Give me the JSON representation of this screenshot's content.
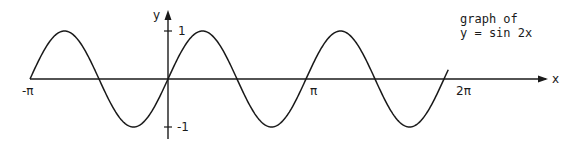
{
  "chart_data": {
    "type": "line",
    "title": "graph of y = sin 2x",
    "title_lines": [
      "graph of",
      "y = sin 2x"
    ],
    "function": "y = sin 2x",
    "xlabel": "x",
    "ylabel": "y",
    "x_ticks": [
      {
        "value": -3.14159,
        "label": "-π"
      },
      {
        "value": 3.14159,
        "label": "π"
      },
      {
        "value": 6.28319,
        "label": "2π"
      }
    ],
    "y_ticks": [
      {
        "value": 1,
        "label": "1"
      },
      {
        "value": -1,
        "label": "-1"
      }
    ],
    "xlim": [
      -3.14159,
      6.38
    ],
    "ylim": [
      -1,
      1
    ],
    "grid": false,
    "legend": null,
    "series": [
      {
        "name": "sin 2x",
        "x_range": [
          -3.14159,
          6.38
        ],
        "points": [
          [
            -3.14159,
            0
          ],
          [
            -2.35619,
            1
          ],
          [
            -1.5708,
            0
          ],
          [
            -0.7854,
            -1
          ],
          [
            0,
            0
          ],
          [
            0.7854,
            1
          ],
          [
            1.5708,
            0
          ],
          [
            2.35619,
            -1
          ],
          [
            3.14159,
            0
          ],
          [
            3.92699,
            1
          ],
          [
            4.71239,
            0
          ],
          [
            5.49779,
            -1
          ],
          [
            6.28319,
            0
          ]
        ]
      }
    ],
    "color": "#1a1a1a"
  },
  "layout": {
    "origin_px": [
      168,
      79
    ],
    "px_per_pi": 138,
    "amplitude_px": 48
  }
}
